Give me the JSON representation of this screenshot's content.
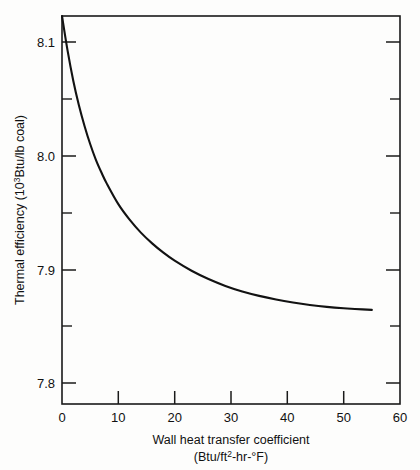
{
  "chart_data": {
    "type": "line",
    "title": "",
    "subtitle": "",
    "xlabel_line1": "Wall heat transfer coefficient",
    "xlabel_line2_pre": "(Btu/ft",
    "xlabel_line2_sup": "2",
    "xlabel_line2_post": "-hr-°F)",
    "ylabel_pre": "Thermal efficiency (10",
    "ylabel_sup": "3",
    "ylabel_post": "Btu/lb coal)",
    "xlim": [
      0,
      60
    ],
    "ylim": [
      7.8,
      8.1
    ],
    "grid": false,
    "legend": "none",
    "x_major_ticks": [
      0,
      10,
      20,
      30,
      40,
      50,
      60
    ],
    "x_tick_labels": [
      "0",
      "10",
      "20",
      "30",
      "40",
      "50",
      "60"
    ],
    "y_major_ticks": [
      7.8,
      7.9,
      8.0,
      8.1
    ],
    "y_tick_labels": [
      "7.8",
      "7.9",
      "8.0",
      "8.1"
    ],
    "y_minor_ticks": [
      7.85,
      7.95,
      8.05
    ],
    "series": [
      {
        "name": "thermal efficiency",
        "x": [
          0,
          1,
          2,
          3,
          4,
          5,
          6,
          7,
          8,
          10,
          12,
          14,
          16,
          18,
          20,
          23,
          26,
          29,
          32,
          35,
          38,
          41,
          44,
          47,
          50,
          52,
          55
        ],
        "y": [
          8.1,
          8.073,
          8.05,
          8.031,
          8.015,
          8.001,
          7.989,
          7.979,
          7.97,
          7.9545,
          7.9425,
          7.9325,
          7.9242,
          7.917,
          7.9108,
          7.903,
          7.8966,
          7.8913,
          7.887,
          7.8836,
          7.8808,
          7.8785,
          7.8766,
          7.8751,
          7.874,
          7.8735,
          7.8728
        ]
      }
    ]
  },
  "axis_tick_labels": {
    "x": [
      "0",
      "10",
      "20",
      "30",
      "40",
      "50",
      "60"
    ],
    "y": [
      "8.1",
      "8.0",
      "7.9",
      "7.8"
    ]
  }
}
